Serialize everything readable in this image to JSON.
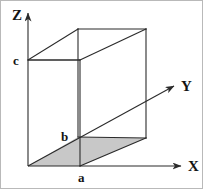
{
  "figure": {
    "type": "diagram",
    "width": 204,
    "height": 190,
    "background_color": "#ffffff",
    "border_color": "#b9b9b9",
    "stroke_color": "#2b2b2b",
    "fill_color": "#c8c8c8",
    "axes": [
      {
        "id": "z",
        "label": "Z",
        "direction": "up",
        "origin": {
          "x": 28,
          "y": 166
        },
        "tip": {
          "x": 28,
          "y": 10
        }
      },
      {
        "id": "y",
        "label": "Y",
        "direction": "up-right (depth)",
        "origin": {
          "x": 28,
          "y": 166
        },
        "tip": {
          "x": 177,
          "y": 84
        }
      },
      {
        "id": "x",
        "label": "X",
        "direction": "right",
        "origin": {
          "x": 28,
          "y": 166
        },
        "tip": {
          "x": 184,
          "y": 166
        }
      }
    ],
    "dimension_labels": [
      {
        "id": "a",
        "label": "a",
        "axis": "X",
        "point": {
          "x": 80,
          "y": 166
        }
      },
      {
        "id": "b",
        "label": "b",
        "axis": "Y",
        "point": {
          "x": 78,
          "y": 137
        }
      },
      {
        "id": "c",
        "label": "c",
        "axis": "Z",
        "point": {
          "x": 28,
          "y": 60
        }
      }
    ],
    "box": {
      "description": "wireframe rectangular parallelepiped with edges a, b, c",
      "vertices": {
        "origin": {
          "x": 28,
          "y": 166
        },
        "x_front": {
          "x": 80,
          "y": 166
        },
        "y_back": {
          "x": 78,
          "y": 137
        },
        "xy_back": {
          "x": 146,
          "y": 138
        },
        "z_top": {
          "x": 28,
          "y": 60
        },
        "xz_top": {
          "x": 80,
          "y": 60
        },
        "yz_top": {
          "x": 78,
          "y": 29
        },
        "xyz_top": {
          "x": 146,
          "y": 29
        }
      },
      "shaded_face": {
        "name": "base-face",
        "fill": "#c8c8c8",
        "points": "28,166 80,166 146,138 78,137"
      }
    }
  },
  "labels": {
    "z": "Z",
    "y": "Y",
    "x": "X",
    "a": "a",
    "b": "b",
    "c": "c"
  }
}
